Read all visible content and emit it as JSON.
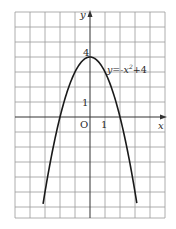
{
  "chart_data": {
    "type": "line",
    "title": "",
    "equation_label": "y=-x²+4",
    "xlabel": "x",
    "ylabel": "y",
    "origin_label": "O",
    "x_tick_labels": [
      "1"
    ],
    "y_tick_labels": [
      "1",
      "4"
    ],
    "xlim": [
      -5,
      5
    ],
    "ylim": [
      -6.7,
      7
    ],
    "grid": true,
    "series": [
      {
        "name": "y=-x^2+4",
        "x": [
          -3.1,
          -3,
          -2.5,
          -2,
          -1.5,
          -1,
          -0.5,
          0,
          0.5,
          1,
          1.5,
          2,
          2.5,
          3,
          3.1
        ],
        "y": [
          -5.61,
          -5,
          -2.25,
          0,
          1.75,
          3,
          3.75,
          4,
          3.75,
          3,
          1.75,
          0,
          -2.25,
          -5,
          -5.61
        ]
      }
    ]
  },
  "labels": {
    "y_axis": "y",
    "x_axis": "x",
    "origin": "O",
    "tick_x_1": "1",
    "tick_y_1": "1",
    "tick_y_4": "4",
    "equation": "y=-x",
    "equation_exp": "2",
    "equation_tail": "+4"
  }
}
